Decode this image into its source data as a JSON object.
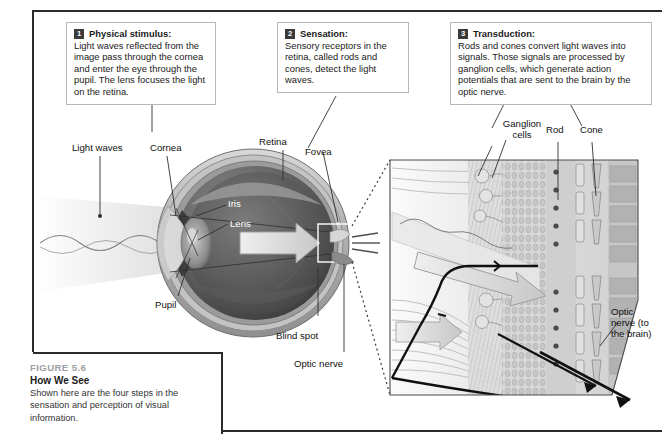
{
  "figure": {
    "number": "FIGURE 5.6",
    "title": "How We See",
    "caption": "Shown here are the four steps in the sensation and perception of visual information."
  },
  "callouts": [
    {
      "badge": "1",
      "title": "Physical stimulus:",
      "body": "Light waves reflected from the image pass through the cornea and enter the eye through the pupil. The lens focuses the light on the retina."
    },
    {
      "badge": "2",
      "title": "Sensation:",
      "body": "Sensory receptors in the retina, called rods and cones, detect the light waves."
    },
    {
      "badge": "3",
      "title": "Transduction:",
      "body": "Rods and cones convert light waves into signals. Those signals are processed by ganglion cells, which generate action potentials that are sent to the brain by the optic nerve."
    }
  ],
  "eye_labels": {
    "light_waves": "Light waves",
    "cornea": "Cornea",
    "retina": "Retina",
    "fovea": "Fovea",
    "iris": "Iris",
    "lens": "Lens",
    "pupil": "Pupil",
    "blind_spot": "Blind spot",
    "optic_nerve": "Optic nerve"
  },
  "inset_labels": {
    "ganglion_cells": "Ganglion cells",
    "rod": "Rod",
    "cone": "Cone",
    "optic_nerve_brain": "Optic nerve (to the brain)"
  },
  "colors": {
    "frame": "#2b2b2b",
    "callout_border": "#b7b7b7",
    "badge": "#3a3a3a",
    "figure_label": "#9aa0a6",
    "text": "#1a1a1a"
  }
}
